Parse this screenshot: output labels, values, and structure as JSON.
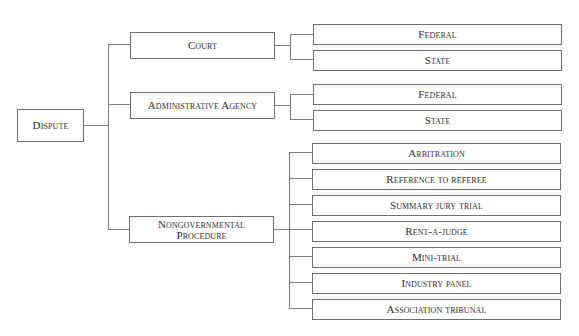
{
  "diagram": {
    "type": "tree",
    "root": {
      "label": "Dispute",
      "children": [
        {
          "label": "Court",
          "children": [
            {
              "label": "Federal"
            },
            {
              "label": "State"
            }
          ]
        },
        {
          "label": "Administrative Agency",
          "children": [
            {
              "label": "Federal"
            },
            {
              "label": "State"
            }
          ]
        },
        {
          "label_lines": [
            "Nongovernmental",
            "Procedure"
          ],
          "children": [
            {
              "label": "Arbitration"
            },
            {
              "label": "Reference to referee"
            },
            {
              "label": "Summary jury trial"
            },
            {
              "label": "Rent-a-judge"
            },
            {
              "label": "Mini-trial"
            },
            {
              "label": "Industry panel"
            },
            {
              "label": "Association tribunal"
            }
          ]
        }
      ]
    }
  },
  "colors": {
    "line": "#7a7a7a",
    "border": "#6e6e6e",
    "text": "#2e2e2e",
    "background": "#ffffff"
  }
}
